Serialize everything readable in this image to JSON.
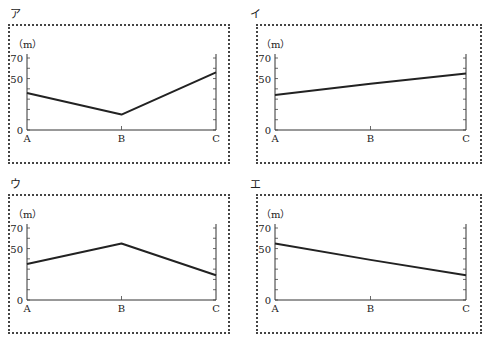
{
  "chart_data": [
    {
      "type": "line",
      "panel_label": "ア",
      "unit_label": "（m）",
      "categories": [
        "A",
        "B",
        "C"
      ],
      "values": [
        36,
        15,
        56
      ],
      "yticks_labeled": [
        "0",
        "50",
        "70"
      ],
      "yminor_step": 10,
      "ylim": [
        0,
        70
      ]
    },
    {
      "type": "line",
      "panel_label": "イ",
      "unit_label": "（m）",
      "categories": [
        "A",
        "B",
        "C"
      ],
      "values": [
        34,
        45,
        55
      ],
      "yticks_labeled": [
        "0",
        "50",
        "70"
      ],
      "yminor_step": 10,
      "ylim": [
        0,
        70
      ]
    },
    {
      "type": "line",
      "panel_label": "ウ",
      "unit_label": "（m）",
      "categories": [
        "A",
        "B",
        "C"
      ],
      "values": [
        35,
        55,
        24
      ],
      "yticks_labeled": [
        "0",
        "50",
        "70"
      ],
      "yminor_step": 10,
      "ylim": [
        0,
        70
      ]
    },
    {
      "type": "line",
      "panel_label": "エ",
      "unit_label": "（m）",
      "categories": [
        "A",
        "B",
        "C"
      ],
      "values": [
        55,
        39,
        24
      ],
      "yticks_labeled": [
        "0",
        "50",
        "70"
      ],
      "yminor_step": 10,
      "ylim": [
        0,
        70
      ]
    }
  ]
}
